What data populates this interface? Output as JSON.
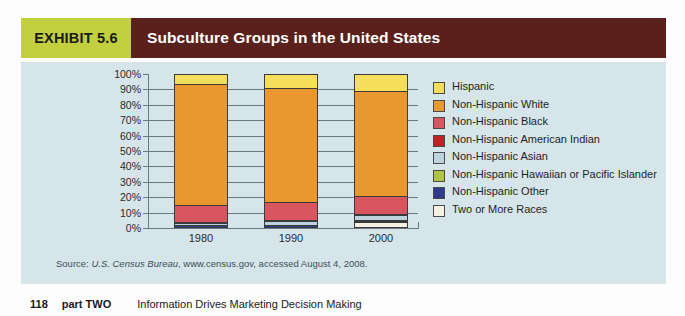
{
  "header": {
    "exhibit_label": "EXHIBIT 5.6",
    "title": "Subculture Groups in the United States",
    "tag_color": "#c2cf3f",
    "bar_color": "#5a211c"
  },
  "source": {
    "prefix": "Source: ",
    "italic": "U.S. Census Bureau",
    "rest": ", www.census.gov, accessed August 4, 2008."
  },
  "footer": {
    "page_number": "118",
    "part": "part TWO",
    "title": "Information Drives Marketing Decision Making"
  },
  "chart_data": {
    "type": "bar",
    "stacked": true,
    "title": "Subculture Groups in the United States",
    "xlabel": "",
    "ylabel": "",
    "categories": [
      "1980",
      "1990",
      "2000"
    ],
    "ylim": [
      0,
      100
    ],
    "ytick_labels": [
      "0%",
      "10%",
      "20%",
      "30%",
      "40%",
      "50%",
      "60%",
      "70%",
      "80%",
      "90%",
      "100%"
    ],
    "yticks": [
      0,
      10,
      20,
      30,
      40,
      50,
      60,
      70,
      80,
      90,
      100
    ],
    "grid": true,
    "legend_position": "right",
    "series": [
      {
        "name": "Two or More Races",
        "color": "#f6f0e2",
        "values": [
          0.0,
          0.0,
          2.4
        ]
      },
      {
        "name": "Non-Hispanic Other",
        "color": "#2e3a8c",
        "values": [
          0.4,
          0.5,
          0.6
        ]
      },
      {
        "name": "Non-Hispanic Hawaiian or Pacific Islander",
        "color": "#afc440",
        "values": [
          0.0,
          0.0,
          0.2
        ]
      },
      {
        "name": "Non-Hispanic Asian",
        "color": "#bdd4e0",
        "values": [
          1.4,
          2.8,
          3.6
        ]
      },
      {
        "name": "Non-Hispanic American Indian",
        "color": "#c41f22",
        "values": [
          0.6,
          0.7,
          0.7
        ]
      },
      {
        "name": "Non-Hispanic Black",
        "color": "#d9555f",
        "values": [
          11.5,
          11.8,
          12.1
        ]
      },
      {
        "name": "Non-Hispanic White",
        "color": "#e8982e",
        "values": [
          79.7,
          75.2,
          68.9
        ]
      },
      {
        "name": "Hispanic",
        "color": "#f5de5a",
        "values": [
          6.4,
          9.0,
          11.5
        ]
      }
    ]
  },
  "legend": {
    "items": [
      {
        "label": "Hispanic",
        "color": "#f5de5a"
      },
      {
        "label": "Non-Hispanic White",
        "color": "#e8982e"
      },
      {
        "label": "Non-Hispanic Black",
        "color": "#d9555f"
      },
      {
        "label": "Non-Hispanic American Indian",
        "color": "#c41f22"
      },
      {
        "label": "Non-Hispanic Asian",
        "color": "#bdd4e0"
      },
      {
        "label": "Non-Hispanic Hawaiian or Pacific Islander",
        "color": "#afc440"
      },
      {
        "label": "Non-Hispanic Other",
        "color": "#2e3a8c"
      },
      {
        "label": "Two or More Races",
        "color": "#f6f0e2"
      }
    ]
  }
}
